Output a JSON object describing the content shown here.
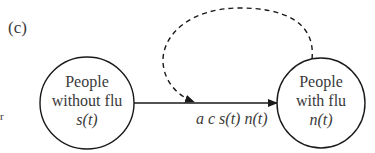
{
  "panel_label": "(c)",
  "edge_fragment": "r",
  "nodes": {
    "susceptible": {
      "line1": "People",
      "line2": "without flu",
      "var": "s(t)"
    },
    "infected": {
      "line1": "People",
      "line2": "with flu",
      "var": "n(t)"
    }
  },
  "edges": {
    "transmission": {
      "label": "a c s(t) n(t)",
      "style": "solid"
    },
    "influence": {
      "style": "dashed",
      "from": "infected",
      "to": "transmission"
    }
  },
  "colors": {
    "stroke": "#1a1a1a",
    "text": "#3a3a3a",
    "background": "#ffffff"
  }
}
